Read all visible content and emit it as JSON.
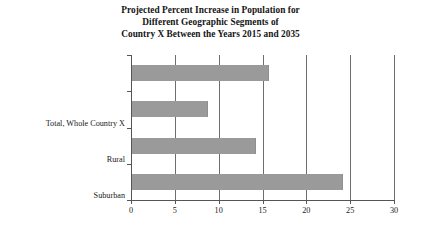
{
  "chart_data": {
    "type": "bar",
    "orientation": "horizontal",
    "title": "Projected Percent Increase in Population for Different Geographic Segments of Country X Between the Years 2015 and 2035",
    "title_lines": [
      "Projected Percent Increase in Population for",
      "Different Geographic Segments of",
      "Country X Between the Years 2015 and 2035"
    ],
    "categories": [
      "Total, Whole Country X",
      "Rural",
      "Suburban",
      "Urban"
    ],
    "values": [
      15.5,
      8.6,
      14.0,
      24.0
    ],
    "xlabel": "",
    "ylabel": "",
    "xlim": [
      0,
      30
    ],
    "xticks": [
      "0",
      "5",
      "10",
      "15",
      "20",
      "25",
      "30"
    ],
    "xtick_values": [
      0,
      5,
      10,
      15,
      20,
      25,
      30
    ],
    "grid": "vertical",
    "legend": "none",
    "bar_color": "#9a9a9a",
    "axis_color": "#555555",
    "gridline_color": "#6e6e6e",
    "background": "#ffffff"
  }
}
